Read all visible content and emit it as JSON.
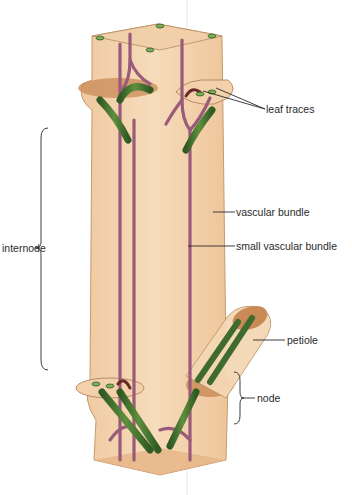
{
  "figure": {
    "labels": {
      "leaf_traces": "leaf traces",
      "vascular_bundle": "vascular bundle",
      "small_vascular_bundle": "small vascular bundle",
      "internode": "internode",
      "petiole": "petiole",
      "node": "node"
    },
    "colors": {
      "stem_fill": "#f2d0a8",
      "stem_edge": "#c79a6e",
      "node_cut": "#c98a55",
      "vascular_bundle": "#3f6b2f",
      "vascular_bundle_light": "#6e9a4c",
      "small_bundle": "#9a5a7a",
      "leaf_trace_dark": "#6a2a2a",
      "leader_line": "#2a2a2a"
    }
  }
}
